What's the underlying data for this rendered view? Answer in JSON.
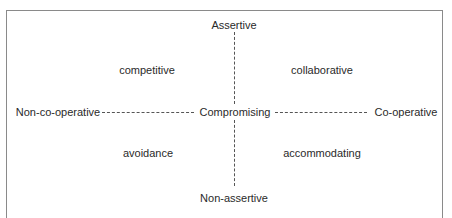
{
  "diagram": {
    "type": "conflict-styles-grid",
    "axes": {
      "vertical": {
        "top": "Assertive",
        "bottom": "Non-assertive"
      },
      "horizontal": {
        "left": "Non-co-operative",
        "right": "Co-operative"
      }
    },
    "center": "Compromising",
    "quadrants": {
      "top_left": "competitive",
      "top_right": "collaborative",
      "bottom_left": "avoidance",
      "bottom_right": "accommodating"
    },
    "colors": {
      "frame": "#8a8a8a",
      "text": "#2a2a2a",
      "dashes": "#555555",
      "background": "#ffffff"
    }
  }
}
